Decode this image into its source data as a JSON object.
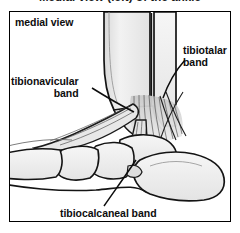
{
  "figure": {
    "caption_cut_top": "Medial view (left) of the ankle",
    "view_label": "medial view",
    "frame_color": "#000000",
    "background_color": "#ffffff",
    "ink_color": "#0d0d0d",
    "bone_fill": "#efefef",
    "shadow_fill": "#b8b8b8"
  },
  "labels": {
    "tibiotalar": {
      "line1": "tibiotalar",
      "line2": "band"
    },
    "tibionavicular": {
      "line1": "tibionavicular",
      "line2": "band"
    },
    "tibiocalcaneal": {
      "full": "tibiocalcaneal band"
    }
  },
  "anatomy": {
    "structures": [
      "tibia",
      "fibula",
      "medial malleolus",
      "talus",
      "calcaneus",
      "navicular",
      "cuneiform",
      "metatarsal",
      "deltoid ligament"
    ]
  }
}
